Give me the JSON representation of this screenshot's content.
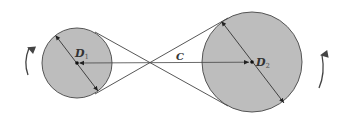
{
  "diagram": {
    "colors": {
      "circle_fill": "#bdbdbd",
      "stroke": "#444444",
      "background": "#ffffff"
    },
    "pulley_small": {
      "label": "D",
      "subscript": "1",
      "center": [
        77,
        63
      ],
      "radius": 35
    },
    "pulley_large": {
      "label": "D",
      "subscript": "2",
      "center": [
        252,
        62
      ],
      "radius": 50
    },
    "center_distance_label": "C",
    "rotation_arrows": [
      {
        "side": "left",
        "direction": "up"
      },
      {
        "side": "right",
        "direction": "up"
      }
    ]
  }
}
